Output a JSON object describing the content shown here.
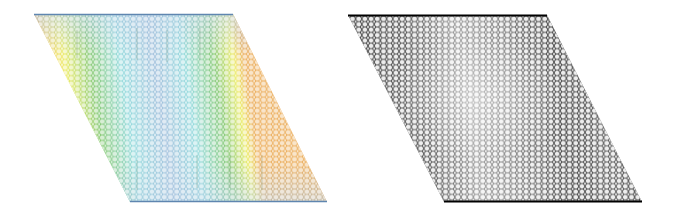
{
  "figure": {
    "panels": [
      {
        "id": "left",
        "title": "Color-mapped honeycomb lattice",
        "colormap": "jet",
        "corners": {
          "top_left": [
            34,
            14
          ],
          "top_right": [
            233,
            14
          ],
          "bottom_right": [
            327,
            202
          ],
          "bottom_left": [
            130,
            202
          ]
        },
        "colors": {
          "low": "#5b8fc7",
          "low_mid": "#7fd3d6",
          "mid": "#6fbf5a",
          "high_mid": "#e8e84a",
          "high": "#e8663a"
        },
        "edge_color_top": "#5f86b0",
        "edge_color_bottom": "#5f86b0"
      },
      {
        "id": "right",
        "title": "Grayscale honeycomb lattice",
        "colormap": "gray",
        "corners": {
          "top_left": [
            11,
            15
          ],
          "top_right": [
            210,
            15
          ],
          "bottom_right": [
            305,
            202
          ],
          "bottom_left": [
            107,
            202
          ]
        },
        "colors": {
          "dark": "#1a1a1a",
          "mid": "#6a6a6a",
          "light": "#c8c8c8"
        },
        "edge_color_top": "#000000",
        "edge_color_bottom": "#000000"
      }
    ]
  }
}
